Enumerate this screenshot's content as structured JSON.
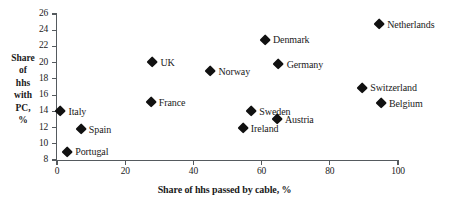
{
  "chart_data": {
    "type": "scatter",
    "title": "",
    "xlabel": "Share of hhs passed by cable, %",
    "ylabel_lines": [
      "Share",
      "of",
      "hhs",
      "with",
      "PC,",
      "%"
    ],
    "xlim": [
      0,
      100
    ],
    "ylim": [
      8,
      26
    ],
    "xticks": [
      0,
      20,
      40,
      60,
      80,
      100
    ],
    "yticks": [
      8,
      10,
      12,
      14,
      16,
      18,
      20,
      22,
      24,
      26
    ],
    "xtick_labels": [
      "0",
      "20",
      "40",
      "60",
      "80",
      "100"
    ],
    "ytick_labels": [
      "8",
      "10",
      "12",
      "14",
      "16",
      "18",
      "20",
      "22",
      "24",
      "26"
    ],
    "grid": false,
    "legend": "none",
    "marker_color": "#111111",
    "axis_color": "#555a5e",
    "points": [
      {
        "label": "Netherlands",
        "x": 94.5,
        "y": 24.7
      },
      {
        "label": "Denmark",
        "x": 61.0,
        "y": 22.8
      },
      {
        "label": "UK",
        "x": 28.0,
        "y": 20.0
      },
      {
        "label": "Germany",
        "x": 65.0,
        "y": 19.8
      },
      {
        "label": "Norway",
        "x": 45.0,
        "y": 18.9
      },
      {
        "label": "Switzerland",
        "x": 89.5,
        "y": 16.9
      },
      {
        "label": "France",
        "x": 27.5,
        "y": 15.1
      },
      {
        "label": "Belgium",
        "x": 95.0,
        "y": 15.0
      },
      {
        "label": "Italy",
        "x": 1.0,
        "y": 14.0
      },
      {
        "label": "Sweden",
        "x": 57.0,
        "y": 14.0
      },
      {
        "label": "Austria",
        "x": 64.5,
        "y": 13.0
      },
      {
        "label": "Ireland",
        "x": 54.5,
        "y": 11.9
      },
      {
        "label": "Spain",
        "x": 7.0,
        "y": 11.8
      },
      {
        "label": "Portugal",
        "x": 3.0,
        "y": 9.0
      }
    ]
  }
}
